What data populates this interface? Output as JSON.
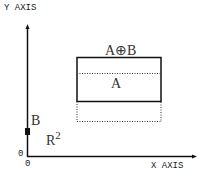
{
  "axes": {
    "y_label": "Y AXIS",
    "x_label": "X AXIS",
    "origin_y": "0",
    "origin_x": "0"
  },
  "labels": {
    "sum": "A⊕B",
    "set_a": "A",
    "set_b": "B",
    "space": "R",
    "space_exp": "2"
  },
  "colors": {
    "line": "#111111",
    "background": "#ffffff"
  }
}
